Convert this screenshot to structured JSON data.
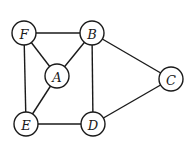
{
  "diagram": {
    "type": "undirected-graph",
    "nodes": [
      {
        "id": "F",
        "label": "F",
        "x": 24,
        "y": 33
      },
      {
        "id": "B",
        "label": "B",
        "x": 92,
        "y": 33
      },
      {
        "id": "A",
        "label": "A",
        "x": 57,
        "y": 76
      },
      {
        "id": "C",
        "label": "C",
        "x": 171,
        "y": 79
      },
      {
        "id": "E",
        "label": "E",
        "x": 26,
        "y": 124
      },
      {
        "id": "D",
        "label": "D",
        "x": 93,
        "y": 124
      }
    ],
    "edges": [
      [
        "F",
        "B"
      ],
      [
        "F",
        "A"
      ],
      [
        "F",
        "E"
      ],
      [
        "B",
        "A"
      ],
      [
        "B",
        "D"
      ],
      [
        "B",
        "C"
      ],
      [
        "A",
        "E"
      ],
      [
        "E",
        "D"
      ],
      [
        "D",
        "C"
      ]
    ],
    "node_radius": 12,
    "colors": {
      "stroke": "#1a1a1a",
      "fill": "#ffffff"
    }
  }
}
